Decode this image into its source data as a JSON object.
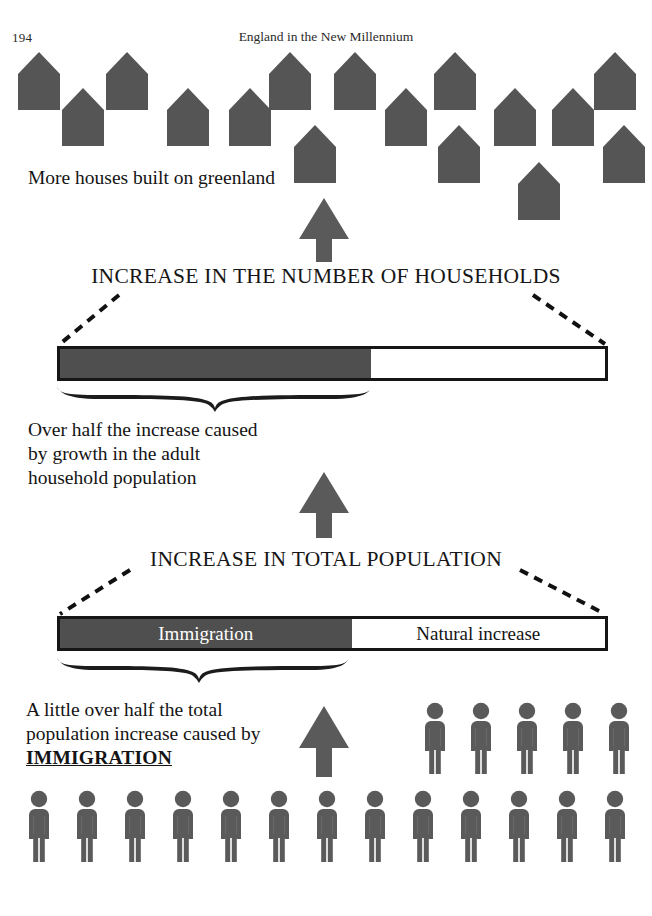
{
  "header": {
    "page_number": "194",
    "running_head": "England in the New Millennium"
  },
  "captions": {
    "houses": "More houses built on greenland",
    "households": "Over half the increase caused\nby growth in the adult\nhousehold population",
    "immigration_lead": "A little over half the total\npopulation increase caused by",
    "immigration_emphasis": "IMMIGRATION"
  },
  "banners": {
    "households": "INCREASE IN THE NUMBER OF HOUSEHOLDS",
    "population": "INCREASE IN TOTAL POPULATION"
  },
  "colors": {
    "figure_fill": "#5a5a5a",
    "house_fill": "#555555",
    "bar_dark": "#4f4f4f",
    "bar_light": "#ffffff",
    "outline": "#161616",
    "arrow": "#5a5a5a"
  },
  "chart_data": {
    "type": "bar",
    "orientation": "horizontal-stacked",
    "charts": [
      {
        "name": "increase-in-the-number-of-households",
        "title": "INCREASE IN THE NUMBER OF HOUSEHOLDS",
        "total": 100,
        "unit": "percent of total increase",
        "segments": [
          {
            "label": "",
            "label_shown": false,
            "value": 57,
            "color": "#4f4f4f",
            "annotation": "Over half the increase caused by growth in the adult household population"
          },
          {
            "label": "",
            "label_shown": false,
            "value": 43,
            "color": "#ffffff"
          }
        ]
      },
      {
        "name": "increase-in-total-population",
        "title": "INCREASE IN TOTAL POPULATION",
        "total": 100,
        "unit": "percent of total increase",
        "segments": [
          {
            "label": "Immigration",
            "label_shown": true,
            "value": 53,
            "color": "#4f4f4f",
            "annotation": "A little over half the total population increase caused by IMMIGRATION"
          },
          {
            "label": "Natural increase",
            "label_shown": true,
            "value": 47,
            "color": "#ffffff"
          }
        ]
      }
    ],
    "pictograms": [
      {
        "name": "houses",
        "symbol": "house",
        "count": 16,
        "meaning": "More houses built on greenland"
      },
      {
        "name": "people-upper",
        "symbol": "person",
        "count": 5,
        "meaning": "Immigration"
      },
      {
        "name": "people-lower",
        "symbol": "person",
        "count": 13,
        "meaning": "Total population"
      }
    ],
    "flow": [
      {
        "from": "increase-in-total-population",
        "to": "increase-in-the-number-of-households",
        "marker": "up-arrow"
      },
      {
        "from": "increase-in-the-number-of-households",
        "to": "houses",
        "marker": "up-arrow"
      },
      {
        "from": "people-lower",
        "to": "increase-in-total-population",
        "marker": "up-arrow"
      }
    ]
  },
  "bars": {
    "households": {
      "dark_pct": 57,
      "light_pct": 43,
      "dark_label": "",
      "light_label": ""
    },
    "population": {
      "dark_pct": 53.5,
      "light_pct": 46.5,
      "dark_label": "Immigration",
      "light_label": "Natural increase"
    }
  },
  "houses": {
    "positions": [
      {
        "x": 18,
        "y": 52
      },
      {
        "x": 106,
        "y": 52
      },
      {
        "x": 269,
        "y": 52
      },
      {
        "x": 334,
        "y": 52
      },
      {
        "x": 434,
        "y": 52
      },
      {
        "x": 594,
        "y": 52
      },
      {
        "x": 62,
        "y": 88
      },
      {
        "x": 167,
        "y": 88
      },
      {
        "x": 229,
        "y": 88
      },
      {
        "x": 385,
        "y": 88
      },
      {
        "x": 494,
        "y": 88
      },
      {
        "x": 552,
        "y": 88
      },
      {
        "x": 294,
        "y": 125
      },
      {
        "x": 438,
        "y": 125
      },
      {
        "x": 603,
        "y": 125
      },
      {
        "x": 518,
        "y": 162
      }
    ]
  },
  "people": {
    "upper_row": {
      "y": 702,
      "xs": [
        420,
        466,
        512,
        558,
        604
      ]
    },
    "lower_row": {
      "y": 790,
      "xs": [
        24,
        72,
        120,
        168,
        216,
        264,
        312,
        360,
        408,
        456,
        504,
        552,
        600
      ]
    }
  }
}
